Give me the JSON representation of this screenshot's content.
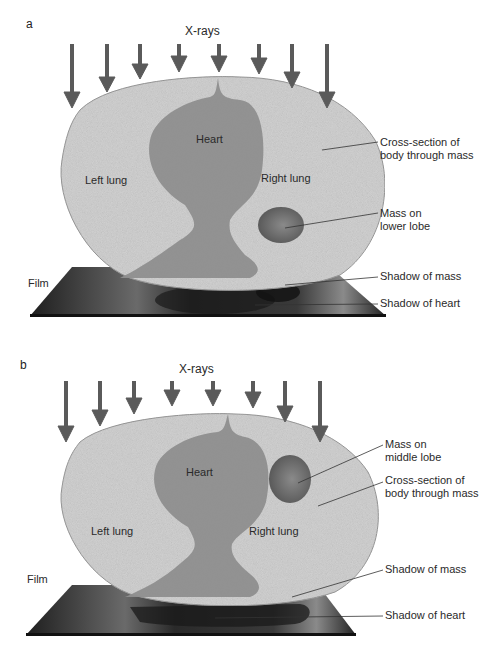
{
  "panels": [
    {
      "letter": "a",
      "title": "X-rays",
      "labels": {
        "heart": "Heart",
        "left_lung": "Left lung",
        "right_lung": "Right lung",
        "film": "Film"
      },
      "callouts": {
        "cross_section": "Cross-section of\nbody through mass",
        "mass": "Mass on\nlower lobe",
        "shadow_mass": "Shadow of mass",
        "shadow_heart": "Shadow of heart"
      }
    },
    {
      "letter": "b",
      "title": "X-rays",
      "labels": {
        "heart": "Heart",
        "left_lung": "Left lung",
        "right_lung": "Right lung",
        "film": "Film"
      },
      "callouts": {
        "mass": "Mass on\nmiddle lobe",
        "cross_section": "Cross-section of\nbody through mass",
        "shadow_mass": "Shadow of mass",
        "shadow_heart": "Shadow of heart"
      }
    }
  ],
  "colors": {
    "body": "#d4d4d4",
    "heart": "#8c8c8c",
    "mass": "#6e6e6e",
    "arrow": "#5a5a5a",
    "film": "#2b2b2b"
  }
}
